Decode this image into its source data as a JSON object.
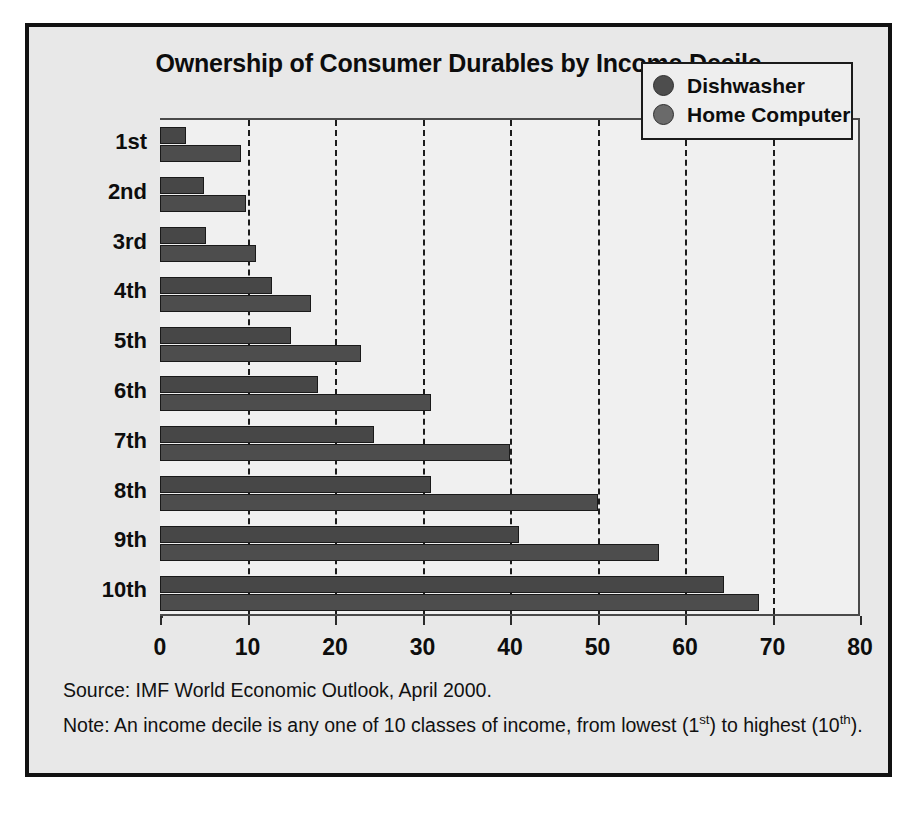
{
  "figure": {
    "title": "Ownership of Consumer Durables by Income Decile",
    "source_note": "Source: IMF World Economic Outlook, April 2000.",
    "note_prefix": "Note: An income decile is any one of 10 classes of income, from lowest (1",
    "note_sup1": "st",
    "note_mid": ") to highest (10",
    "note_sup2": "th",
    "note_suffix": ").",
    "border_color": "#111111",
    "panel_color": "#e8e8e8"
  },
  "legend": {
    "position": "top-right",
    "entries": [
      {
        "label": "Dishwasher",
        "color": "#4d4d4d",
        "marker": "circle"
      },
      {
        "label": "Home Computer",
        "color": "#6a6a6a",
        "marker": "circle"
      }
    ]
  },
  "chart_data": {
    "type": "bar",
    "orientation": "horizontal",
    "title": "Ownership of Consumer Durables by Income Decile",
    "xlabel": "",
    "ylabel": "",
    "xlim": [
      0,
      80
    ],
    "ylim": null,
    "grid": true,
    "grid_style": "dashed-vertical",
    "legend_position": "top-right",
    "categories": [
      "1st",
      "2nd",
      "3rd",
      "4th",
      "5th",
      "6th",
      "7th",
      "8th",
      "9th",
      "10th"
    ],
    "xticks": [
      0,
      10,
      20,
      30,
      40,
      50,
      60,
      70,
      80
    ],
    "xtick_labels": [
      "0",
      "10",
      "20",
      "30",
      "40",
      "50",
      "60",
      "70",
      "80"
    ],
    "series": [
      {
        "name": "Dishwasher",
        "color": "#4d4d4d",
        "values": [
          9.3,
          9.8,
          11.0,
          17.3,
          23.0,
          31.0,
          40.0,
          50.0,
          57.0,
          68.5
        ]
      },
      {
        "name": "Home Computer",
        "color": "#474747",
        "values": [
          3.0,
          5.0,
          5.3,
          12.8,
          15.0,
          18.0,
          24.5,
          31.0,
          41.0,
          64.5
        ]
      }
    ]
  }
}
